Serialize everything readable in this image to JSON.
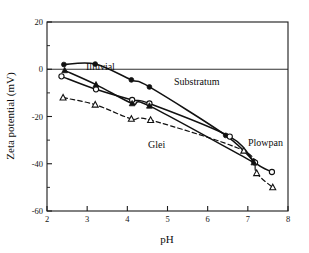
{
  "chart_data": {
    "type": "line",
    "title": "",
    "xlabel": "pH",
    "ylabel": "Zeta potential (mV)",
    "xlim": [
      2,
      8
    ],
    "ylim": [
      -60,
      20
    ],
    "xticks": [
      2,
      3,
      4,
      5,
      6,
      7,
      8
    ],
    "yticks": [
      20,
      0,
      -20,
      -40,
      -60
    ],
    "yticks_minor": [
      10,
      -10,
      -30,
      -50
    ],
    "grid": false,
    "legend_position": "inline-annotations",
    "reference_lines": [
      {
        "axis": "y",
        "value": 0
      }
    ],
    "series": [
      {
        "name": "Substratum",
        "marker": "filled-circle",
        "linestyle": "solid",
        "annotation_label": "Substratum",
        "points": [
          {
            "x": 2.42,
            "y": 2.0
          },
          {
            "x": 3.2,
            "y": 2.2
          },
          {
            "x": 4.1,
            "y": -4.5
          },
          {
            "x": 4.55,
            "y": -7.5
          },
          {
            "x": 6.45,
            "y": -28.0
          },
          {
            "x": 7.15,
            "y": -39.0
          }
        ]
      },
      {
        "name": "Illuvial",
        "marker": "open-circle",
        "linestyle": "solid",
        "annotation_label": "Illuvial",
        "points": [
          {
            "x": 2.36,
            "y": -3.0
          },
          {
            "x": 3.22,
            "y": -8.5
          },
          {
            "x": 4.12,
            "y": -13.0
          },
          {
            "x": 4.55,
            "y": -14.5
          },
          {
            "x": 6.55,
            "y": -28.5
          },
          {
            "x": 7.18,
            "y": -39.5
          },
          {
            "x": 7.6,
            "y": -43.5
          }
        ]
      },
      {
        "name": "Plowpan",
        "marker": "filled-triangle",
        "linestyle": "solid",
        "annotation_label": "Plowpan",
        "points": [
          {
            "x": 2.44,
            "y": -0.5
          },
          {
            "x": 3.22,
            "y": -6.5
          },
          {
            "x": 4.12,
            "y": -14.5
          },
          {
            "x": 4.55,
            "y": -15.5
          },
          {
            "x": 7.15,
            "y": -39.5
          }
        ]
      },
      {
        "name": "Glei",
        "marker": "open-triangle",
        "linestyle": "dashed",
        "annotation_label": "Glei",
        "points": [
          {
            "x": 2.4,
            "y": -12.0
          },
          {
            "x": 3.2,
            "y": -15.0
          },
          {
            "x": 4.1,
            "y": -21.0
          },
          {
            "x": 4.58,
            "y": -21.5
          },
          {
            "x": 6.9,
            "y": -34.5
          },
          {
            "x": 7.22,
            "y": -44.0
          },
          {
            "x": 7.62,
            "y": -50.0
          }
        ]
      }
    ]
  },
  "annotations": {
    "illuvial": "Illuvial",
    "substratum": "Substratum",
    "glei": "Glei",
    "plowpan": "Plowpan"
  },
  "axes": {
    "x_title": "pH",
    "y_title": "Zeta potential (mV)",
    "x_tick_labels": [
      "2",
      "3",
      "4",
      "5",
      "6",
      "7",
      "8"
    ],
    "y_tick_labels": [
      "20",
      "0",
      "-20",
      "-40",
      "-60"
    ]
  }
}
